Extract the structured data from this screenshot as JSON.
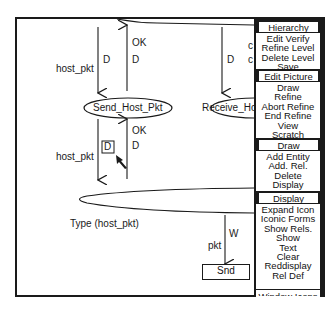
{
  "diagram": {
    "nodes": {
      "send_host_pkt": "Send_Host_Pkt",
      "receive_host": "Receive_Hos",
      "snd": "Snd",
      "d_box": "D"
    },
    "labels": {
      "host_pkt_top": "host_pkt",
      "host_pkt_mid": "host_pkt",
      "d1": "D",
      "d2": "D",
      "d3": "D",
      "d4": "D",
      "ok1": "OK",
      "ok2": "OK",
      "type_label": "Type (host_pkt)",
      "w": "W",
      "pkt": "pkt",
      "partial_c1": "c",
      "partial_c2": "c"
    }
  },
  "menu": {
    "sections": [
      {
        "header": "Hierarchy",
        "items": [
          "Edit Verify",
          "Refine Level",
          "Delete Level",
          "Save"
        ]
      },
      {
        "header": "Edit Picture",
        "items": [
          "Draw",
          "Refine",
          "Abort Refine",
          "End Refine",
          "View",
          "Scratch"
        ]
      },
      {
        "header": "Draw",
        "items": [
          "Add Entity",
          "Add. Rel.",
          "Delete",
          "Display"
        ]
      },
      {
        "header": "Display",
        "items": [
          "Expand Icon",
          "Iconic Forms",
          "Show Rels.",
          "Show",
          "Text",
          "Clear",
          "Reddisplay",
          "Rel Def"
        ]
      },
      {
        "header": "Window Icons",
        "items": []
      }
    ]
  },
  "colors": {
    "frame": "#1a1a1a",
    "background": "#ffffff",
    "menu_bg": "#1a1a1a"
  }
}
